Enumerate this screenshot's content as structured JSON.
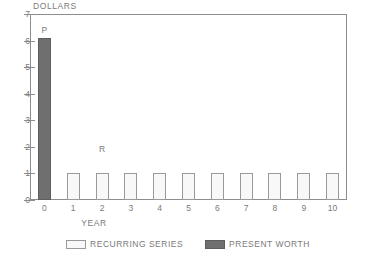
{
  "chart_data": {
    "type": "bar",
    "title": "",
    "xlabel": "YEAR",
    "ylabel": "DOLLARS",
    "categories": [
      "0",
      "1",
      "2",
      "3",
      "4",
      "5",
      "6",
      "7",
      "8",
      "9",
      "10"
    ],
    "xlim": [
      -0.5,
      10.5
    ],
    "ylim": [
      0,
      7
    ],
    "ytick_labels": [
      "0",
      "1",
      "2",
      "3",
      "4",
      "5",
      "6",
      "7"
    ],
    "ytick_values": [
      0,
      1,
      2,
      3,
      4,
      5,
      6,
      7
    ],
    "grid": false,
    "legend_position": "bottom-center",
    "series": [
      {
        "name": "PRESENT WORTH",
        "color": "#6f6f6f",
        "fill": "solid",
        "values": [
          6.1,
          null,
          null,
          null,
          null,
          null,
          null,
          null,
          null,
          null,
          null
        ]
      },
      {
        "name": "RECURRING SERIES",
        "color": "#d0d0d0",
        "fill": "crosshatch",
        "values": [
          null,
          1,
          1,
          1,
          1,
          1,
          1,
          1,
          1,
          1,
          1
        ]
      }
    ],
    "annotations": [
      {
        "text": "P",
        "x": 0,
        "y": 6.1
      },
      {
        "text": "R",
        "x": 2,
        "y": 1.6
      }
    ]
  },
  "axes": {
    "y_title": "DOLLARS",
    "x_title": "YEAR",
    "y_ticks": [
      "7",
      "6",
      "5",
      "4",
      "3",
      "2",
      "1",
      "0"
    ],
    "x_ticks": [
      "0",
      "1",
      "2",
      "3",
      "4",
      "5",
      "6",
      "7",
      "8",
      "9",
      "10"
    ]
  },
  "legend": {
    "items": [
      {
        "label": "RECURRING SERIES",
        "swatch": "recurring"
      },
      {
        "label": "PRESENT WORTH",
        "swatch": "present"
      }
    ]
  },
  "annotations": {
    "present_worth_marker": "P",
    "recurring_marker": "R"
  }
}
